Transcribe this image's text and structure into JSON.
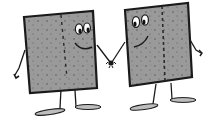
{
  "illustration": {
    "subject": "Two cartoon square characters holding hands",
    "colors": {
      "background": "#ffffff",
      "body_fill": "#9a9a9a",
      "outline": "#1a1a1a",
      "foot_fill": "#bdbdbd",
      "eye_white": "#ffffff"
    },
    "characters": [
      {
        "name": "left-character",
        "facing": "right",
        "expression": "smiling"
      },
      {
        "name": "right-character",
        "facing": "left",
        "expression": "smiling"
      }
    ]
  }
}
